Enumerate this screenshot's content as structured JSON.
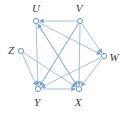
{
  "figure": {
    "kind": "directed-graph-diagram",
    "width": 123,
    "height": 114,
    "background_color": "#ffffff",
    "edge_color": "#7ba6d0",
    "node_stroke_color": "#5b8fc4",
    "node_fill_color": "#ffffff",
    "label_color": "#3a3a3a",
    "node_radius": 2.6,
    "edge_width": 0.7
  },
  "nodes": [
    {
      "id": "U",
      "label": "U",
      "x": 36,
      "y": 21,
      "label_x": 36,
      "label_y": 8
    },
    {
      "id": "V",
      "label": "V",
      "x": 80,
      "y": 21,
      "label_x": 79,
      "label_y": 8
    },
    {
      "id": "W",
      "label": "W",
      "x": 104,
      "y": 56,
      "label_x": 114,
      "label_y": 57
    },
    {
      "id": "Z",
      "label": "Z",
      "x": 21,
      "y": 51,
      "label_x": 11,
      "label_y": 50
    },
    {
      "id": "Y",
      "label": "Y",
      "x": 38,
      "y": 89,
      "label_x": 37,
      "label_y": 102
    },
    {
      "id": "X",
      "label": "X",
      "x": 79,
      "y": 89,
      "label_x": 78,
      "label_y": 102
    }
  ],
  "edges": [
    {
      "id": "V-U",
      "from": "V",
      "to": "U",
      "directed": true
    },
    {
      "id": "U-Y",
      "from": "U",
      "to": "Y",
      "directed": true
    },
    {
      "id": "U-X",
      "from": "U",
      "to": "X",
      "directed": true
    },
    {
      "id": "U-W",
      "from": "U",
      "to": "W",
      "directed": true
    },
    {
      "id": "V-Y",
      "from": "V",
      "to": "Y",
      "directed": true
    },
    {
      "id": "V-X",
      "from": "V",
      "to": "X",
      "directed": true
    },
    {
      "id": "V-W",
      "from": "V",
      "to": "W",
      "directed": true
    },
    {
      "id": "W-Y",
      "from": "W",
      "to": "Y",
      "directed": true
    },
    {
      "id": "W-X",
      "from": "W",
      "to": "X",
      "directed": true
    },
    {
      "id": "Z-Y",
      "from": "Z",
      "to": "Y",
      "directed": true
    },
    {
      "id": "Z-X",
      "from": "Z",
      "to": "X",
      "directed": true
    },
    {
      "id": "Y-X",
      "from": "Y",
      "to": "X",
      "directed": true
    },
    {
      "id": "X-U",
      "from": "X",
      "to": "U",
      "directed": true
    },
    {
      "id": "Y-V",
      "from": "Y",
      "to": "V",
      "directed": false
    }
  ]
}
